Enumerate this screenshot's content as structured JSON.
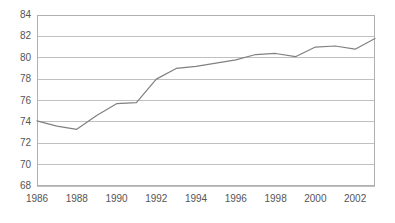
{
  "chart_data": {
    "type": "line",
    "title": "",
    "subtitle": "",
    "xlabel": "",
    "ylabel": "",
    "legend": [],
    "legend_position": "none",
    "grid": true,
    "grid_axis": "y",
    "xlim": [
      1986,
      2003
    ],
    "ylim": [
      68,
      84
    ],
    "y_ticks": [
      68,
      70,
      72,
      74,
      76,
      78,
      80,
      82,
      84
    ],
    "y_tick_labels": [
      "68",
      "70",
      "72",
      "74",
      "76",
      "78",
      "80",
      "82",
      "84"
    ],
    "x_ticks": [
      1986,
      1988,
      1990,
      1992,
      1994,
      1996,
      1998,
      2000,
      2002
    ],
    "x_tick_labels": [
      "1986",
      "1988",
      "1990",
      "1992",
      "1994",
      "1996",
      "1998",
      "2000",
      "2002"
    ],
    "x": [
      1986,
      1987,
      1988,
      1989,
      1990,
      1991,
      1992,
      1993,
      1994,
      1995,
      1996,
      1997,
      1998,
      1999,
      2000,
      2001,
      2002,
      2003
    ],
    "values": [
      74.1,
      73.6,
      73.3,
      74.6,
      75.7,
      75.8,
      78.0,
      79.0,
      79.2,
      79.5,
      79.8,
      80.3,
      80.4,
      80.1,
      81.0,
      81.1,
      80.8,
      81.8
    ],
    "series": [
      {
        "name": "series-1",
        "values": [
          74.1,
          73.6,
          73.3,
          74.6,
          75.7,
          75.8,
          78.0,
          79.0,
          79.2,
          79.5,
          79.8,
          80.3,
          80.4,
          80.1,
          81.0,
          81.1,
          80.8,
          81.8
        ]
      }
    ],
    "colors": {
      "line": "#808080",
      "grid": "#c0c0c0",
      "border": "#b0b0b0",
      "tick_text": "#555555",
      "background": "#ffffff"
    },
    "plot_box": {
      "left": 37,
      "top": 15,
      "right": 375,
      "bottom": 186
    }
  }
}
